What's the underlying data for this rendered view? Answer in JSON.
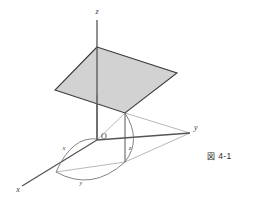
{
  "figure": {
    "caption_symbol": "図",
    "caption_number": "4-1",
    "caption_full": "図 4-1",
    "colors": {
      "axis_line": "#555555",
      "plane_fill": "#d2d2d2",
      "plane_stroke": "#3c3c3c",
      "helper_line": "#8a8a8a",
      "arc_line": "#6e6e6e",
      "text": "#3a3a3a",
      "background": "#ffffff"
    },
    "axes": [
      {
        "id": "z",
        "label": "z",
        "direction": "up",
        "label_x": 97,
        "label_y": 14
      },
      {
        "id": "y",
        "label": "y",
        "direction": "right",
        "label_x": 194,
        "label_y": 130
      },
      {
        "id": "x",
        "label": "x",
        "direction": "lower-left",
        "label_x": 18,
        "label_y": 190
      }
    ],
    "origin": {
      "label": "O",
      "x": 97,
      "y": 140,
      "label_x": 101,
      "label_y": 139
    },
    "component_labels": [
      {
        "id": "x-component",
        "label": "x",
        "x": 64,
        "y": 150
      },
      {
        "id": "y-component",
        "label": "y",
        "x": 81,
        "y": 183
      },
      {
        "id": "z-component",
        "label": "z",
        "x": 130,
        "y": 150
      }
    ],
    "plane": {
      "name": "shaded-plane",
      "points": "97,47 177,73 125,113 55,90",
      "fill": "#d2d2d2",
      "stroke": "#3c3c3c"
    },
    "base": {
      "name": "base-quadrilateral",
      "points": "97,140 125,113 125,162 56,172"
    }
  }
}
